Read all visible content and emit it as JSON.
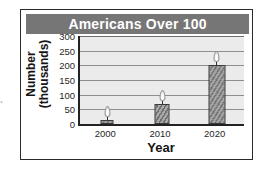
{
  "figure": {
    "title": "Americans Over 100",
    "banner_color": "#767676",
    "plot_background": "#ebebeb",
    "frame_color": "#2b2b2b"
  },
  "edge_artifact": {
    "text": "·"
  },
  "chart_data": {
    "type": "bar",
    "title": "Americans Over 100",
    "xlabel": "Year",
    "ylabel_line1": "Number",
    "ylabel_line2": "(thousands)",
    "categories": [
      "2000",
      "2010",
      "2020"
    ],
    "values": [
      15,
      68,
      202
    ],
    "yticks": [
      0,
      50,
      100,
      150,
      200,
      250,
      300
    ],
    "ytick_labels": [
      "0",
      "50",
      "100",
      "150",
      "200",
      "250",
      "300"
    ],
    "ylim": [
      0,
      300
    ],
    "grid": true,
    "legend": "none",
    "bar_style": "candle",
    "bar_color": "#8a8a8a",
    "units": "thousands"
  }
}
